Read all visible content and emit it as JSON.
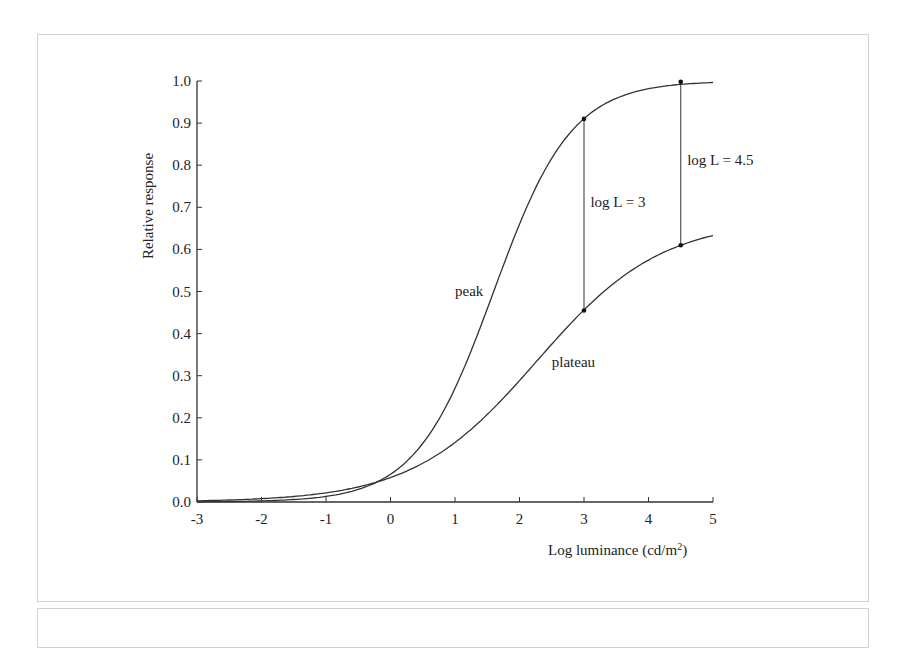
{
  "chart_data": {
    "type": "line",
    "title": "",
    "xlabel": "Log luminance (cd/m",
    "xlabel_superscript": "2",
    "xlabel_close": ")",
    "ylabel": "Relative response",
    "xlim": [
      -3,
      5
    ],
    "ylim": [
      0,
      1.0
    ],
    "grid": false,
    "legend": "none (inline labels)",
    "x_ticks": [
      "-3",
      "-2",
      "-1",
      "0",
      "1",
      "2",
      "3",
      "4",
      "5"
    ],
    "y_ticks": [
      "0.0",
      "0.1",
      "0.2",
      "0.3",
      "0.4",
      "0.5",
      "0.6",
      "0.7",
      "0.8",
      "0.9",
      "1.0"
    ],
    "x": [
      -3,
      -2.5,
      -2,
      -1.5,
      -1,
      -0.5,
      0,
      0.5,
      1,
      1.5,
      2,
      2.5,
      3,
      3.5,
      4,
      4.5,
      5
    ],
    "series": [
      {
        "name": "peak",
        "values": [
          0.002,
          0.005,
          0.01,
          0.022,
          0.046,
          0.095,
          0.07,
          0.12,
          0.2,
          0.4,
          0.66,
          0.8,
          0.91,
          0.96,
          0.98,
          0.99,
          1.0
        ]
      },
      {
        "name": "plateau",
        "values": [
          0.001,
          0.003,
          0.006,
          0.011,
          0.019,
          0.031,
          0.05,
          0.08,
          0.12,
          0.19,
          0.28,
          0.37,
          0.455,
          0.53,
          0.58,
          0.61,
          0.63
        ]
      }
    ],
    "annotations": [
      {
        "text": "peak",
        "x": 1.0,
        "y": 0.49
      },
      {
        "text": "plateau",
        "x": 2.5,
        "y": 0.32
      },
      {
        "text": "log L = 3",
        "x": 3.1,
        "y": 0.7,
        "line_x": 3,
        "from": 0.455,
        "to": 0.91
      },
      {
        "text": "log L = 4.5",
        "x": 4.6,
        "y": 0.8,
        "line_x": 4.5,
        "from": 0.61,
        "to": 0.998
      }
    ]
  }
}
